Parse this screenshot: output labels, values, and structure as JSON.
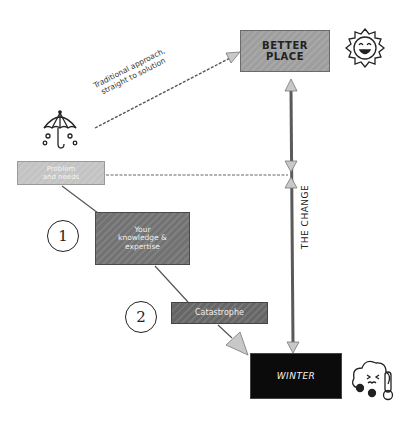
{
  "diagram": {
    "nodes": {
      "better_place": {
        "label_line1": "BETTER",
        "label_line2": "PLACE"
      },
      "problem": {
        "label_line1": "Problem",
        "label_line2": "and needs"
      },
      "knowledge": {
        "label_line1": "Your",
        "label_line2": "knowledge &",
        "label_line3": "expertise"
      },
      "catastrophe": {
        "label": "Catastrophe"
      },
      "winter": {
        "label": "WINTER"
      }
    },
    "steps": [
      {
        "number": "1"
      },
      {
        "number": "2"
      }
    ],
    "annotations": {
      "traditional_line1": "Traditional approach,",
      "traditional_line2": "straight to solution",
      "the_change": "THE CHANGE"
    },
    "icons": {
      "umbrella": "umbrella-rain-icon",
      "sun": "smiling-sun-icon",
      "winter": "cold-cloud-thermometer-icon"
    },
    "colors": {
      "better_place": "#9e9e9e",
      "problem": "#c3c3c3",
      "knowledge": "#727272",
      "catastrophe": "#666666",
      "winter": "#0b0b0b",
      "arrow_head": "#c8c8c8",
      "line": "#555555"
    }
  }
}
